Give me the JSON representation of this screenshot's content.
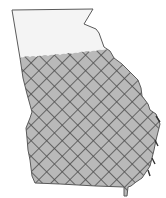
{
  "map": {
    "region": "Georgia",
    "colors": {
      "background": "#ffffff",
      "unshaded_fill": "#f4f4f4",
      "shaded_fill": "#b9b9b9",
      "hatch_lines": "#4e4e4e",
      "border": "#5a5a5a"
    },
    "areas": [
      {
        "name": "northern-region",
        "pattern": "none"
      },
      {
        "name": "southern-region",
        "pattern": "crosshatch"
      }
    ]
  }
}
